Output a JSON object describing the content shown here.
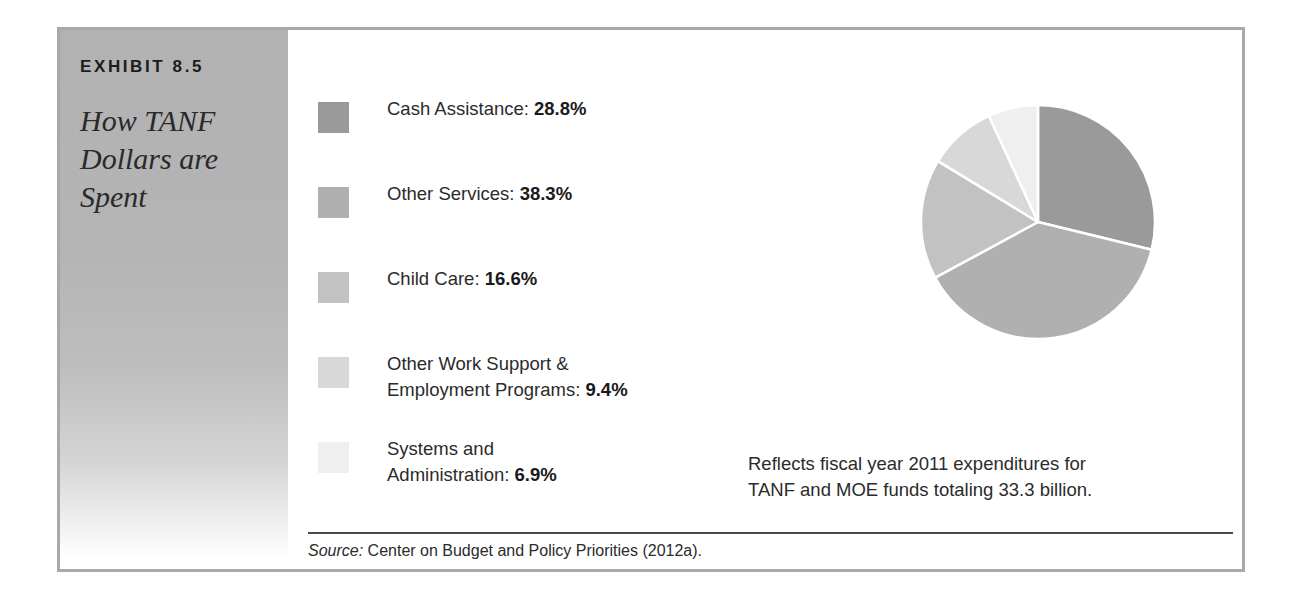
{
  "exhibit": {
    "label": "EXHIBIT 8.5",
    "caption": "How TANF Dollars are Spent",
    "note_line1": "Reflects fiscal year 2011 expenditures for",
    "note_line2": "TANF and MOE funds totaling 33.3 billion.",
    "source_prefix": "Source:",
    "source_text": " Center on Budget and Policy Priorities (2012a)."
  },
  "chart_data": {
    "type": "pie",
    "title": "How TANF Dollars are Spent",
    "unit": "%",
    "total": 100,
    "start_angle": 0,
    "direction": "clockwise",
    "slice_separator_color": "#ffffff",
    "categories": [
      "Cash Assistance",
      "Other Services",
      "Child Care",
      "Other Work Support & Employment Programs",
      "Systems and Administration"
    ],
    "values": [
      28.8,
      38.3,
      16.6,
      9.4,
      6.9
    ],
    "colors": [
      "#9a9a9a",
      "#b0b0b0",
      "#c2c2c2",
      "#d8d8d8",
      "#efefef"
    ],
    "legend_position": "left",
    "legend": [
      {
        "label": "Cash Assistance: ",
        "value": "28.8%",
        "color": "#9a9a9a"
      },
      {
        "label": "Other Services: ",
        "value": "38.3%",
        "color": "#b0b0b0"
      },
      {
        "label": "Child Care: ",
        "value": "16.6%",
        "color": "#c2c2c2"
      },
      {
        "label": "Other Work Support &<br>Employment Programs: ",
        "value": "9.4%",
        "color": "#d8d8d8"
      },
      {
        "label": "Systems and<br>Administration: ",
        "value": "6.9%",
        "color": "#efefef"
      }
    ],
    "annotation": "Reflects fiscal year 2011 expenditures for TANF and MOE funds totaling 33.3 billion."
  }
}
